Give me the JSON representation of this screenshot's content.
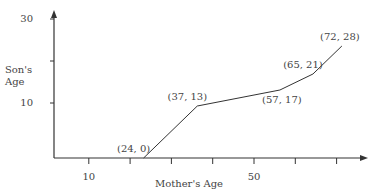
{
  "chart_data": {
    "type": "line",
    "title": "",
    "xlabel": "Mother's Age",
    "ylabel": [
      "Son's",
      "Age"
    ],
    "xlim": [
      0,
      80
    ],
    "ylim": [
      0,
      32
    ],
    "x_ticks": [
      10,
      20,
      30,
      40,
      50,
      60,
      70
    ],
    "x_tick_labels": [
      {
        "value": 10,
        "label": "10"
      },
      {
        "value": 50,
        "label": "50"
      }
    ],
    "y_ticks": [
      10,
      20,
      30
    ],
    "y_tick_labels": [
      {
        "value": 10,
        "label": "10"
      },
      {
        "value": 30,
        "label": "30"
      }
    ],
    "grid": false,
    "series": [
      {
        "name": "Son's Age vs Mother's Age",
        "points": [
          {
            "x": 24,
            "y": 0,
            "label": "(24, 0)",
            "label_pos": "top-left"
          },
          {
            "x": 37,
            "y": 13,
            "label": "(37, 13)",
            "label_pos": "top-left"
          },
          {
            "x": 57,
            "y": 17,
            "label": "(57, 17)",
            "label_pos": "bottom"
          },
          {
            "x": 65,
            "y": 21,
            "label": "(65, 21)",
            "label_pos": "top-left"
          },
          {
            "x": 72,
            "y": 28,
            "label": "(72, 28)",
            "label_pos": "top"
          }
        ]
      }
    ],
    "colors": {
      "axis": "#333333",
      "line": "#333333",
      "text": "#444444"
    }
  }
}
